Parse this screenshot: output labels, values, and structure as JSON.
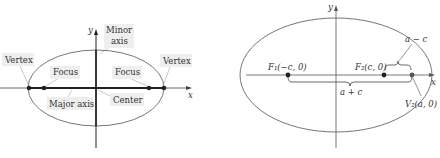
{
  "left_diagram": {
    "axis_x_label": "x",
    "axis_y_label": "y",
    "labels": {
      "vertex_left": "Vertex",
      "vertex_right": "Vertex",
      "focus_left": "Focus",
      "focus_right": "Focus",
      "minor_axis_line1": "Minor",
      "minor_axis_line2": "axis",
      "major_axis": "Major axis",
      "center": "Center"
    }
  },
  "right_diagram": {
    "axis_x_label": "x",
    "axis_y_label": "y",
    "labels": {
      "f1": "F₁(−c, 0)",
      "f2": "F₂(c, 0)",
      "v2": "V₂(a, 0)",
      "a_minus_c": "a − c",
      "a_plus_c": "a + c"
    }
  },
  "colors": {
    "ellipse_stroke": "#777777",
    "axis_stroke": "#222222",
    "label_box": "#eeeeee",
    "text": "#333333"
  }
}
